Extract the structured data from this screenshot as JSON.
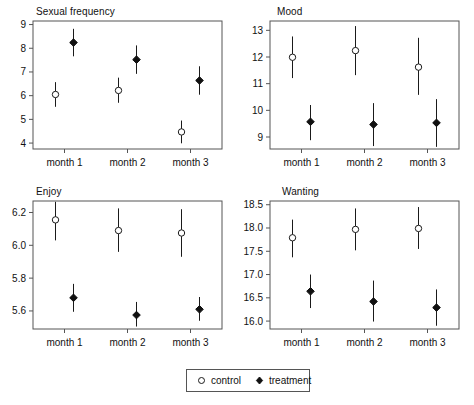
{
  "legend": {
    "entries": [
      {
        "label": "control",
        "marker": "open-circle-marker"
      },
      {
        "label": "treatment",
        "marker": "filled-diamond-marker"
      }
    ]
  },
  "series_colors": {
    "control": "#ffffff",
    "treatment": "#111111",
    "axis": "#555555"
  },
  "chart_data": [
    {
      "type": "scatter",
      "title": "Sexual frequency",
      "xlabel": "",
      "ylabel": "",
      "categories": [
        "month 1",
        "month 2",
        "month 3"
      ],
      "ylim": [
        3.75,
        9.15
      ],
      "yticks": [
        4,
        5,
        6,
        7,
        8,
        9
      ],
      "ytick_labels": [
        "4",
        "5",
        "6",
        "7",
        "8",
        "9"
      ],
      "grid": false,
      "legend_position": "bottom",
      "series": [
        {
          "name": "control",
          "values": [
            6.05,
            6.22,
            4.47
          ],
          "err_low": [
            5.53,
            5.7,
            3.99
          ],
          "err_high": [
            6.57,
            6.76,
            4.95
          ]
        },
        {
          "name": "treatment",
          "values": [
            8.24,
            7.52,
            6.64
          ],
          "err_low": [
            7.66,
            6.92,
            6.04
          ],
          "err_high": [
            8.82,
            8.12,
            7.24
          ]
        }
      ]
    },
    {
      "type": "scatter",
      "title": "Mood",
      "xlabel": "",
      "ylabel": "",
      "categories": [
        "month 1",
        "month 2",
        "month 3"
      ],
      "ylim": [
        8.55,
        13.35
      ],
      "yticks": [
        9,
        10,
        11,
        12,
        13
      ],
      "ytick_labels": [
        "9",
        "10",
        "11",
        "12",
        "13"
      ],
      "grid": false,
      "legend_position": "bottom",
      "series": [
        {
          "name": "control",
          "values": [
            11.99,
            12.24,
            11.62
          ],
          "err_low": [
            11.21,
            11.32,
            10.58
          ],
          "err_high": [
            12.77,
            13.16,
            12.72
          ]
        },
        {
          "name": "treatment",
          "values": [
            9.57,
            9.47,
            9.53
          ],
          "err_low": [
            8.88,
            8.66,
            8.63
          ],
          "err_high": [
            10.2,
            10.27,
            10.42
          ]
        }
      ]
    },
    {
      "type": "scatter",
      "title": "Enjoy",
      "xlabel": "",
      "ylabel": "",
      "categories": [
        "month 1",
        "month 2",
        "month 3"
      ],
      "ylim": [
        5.49,
        6.27
      ],
      "yticks": [
        5.6,
        5.8,
        6.0,
        6.2
      ],
      "ytick_labels": [
        "5.6",
        "5.8",
        "6.0",
        "6.2"
      ],
      "grid": false,
      "legend_position": "bottom",
      "series": [
        {
          "name": "control",
          "values": [
            6.155,
            6.09,
            6.075
          ],
          "err_low": [
            6.03,
            5.96,
            5.93
          ],
          "err_high": [
            6.265,
            6.225,
            6.22
          ]
        },
        {
          "name": "treatment",
          "values": [
            5.68,
            5.575,
            5.61
          ],
          "err_low": [
            5.595,
            5.505,
            5.54
          ],
          "err_high": [
            5.765,
            5.655,
            5.685
          ]
        }
      ]
    },
    {
      "type": "scatter",
      "title": "Wanting",
      "xlabel": "",
      "ylabel": "",
      "categories": [
        "month 1",
        "month 2",
        "month 3"
      ],
      "ylim": [
        15.83,
        18.58
      ],
      "yticks": [
        16.0,
        16.5,
        17.0,
        17.5,
        18.0,
        18.5
      ],
      "ytick_labels": [
        "16.0",
        "16.5",
        "17.0",
        "17.5",
        "18.0",
        "18.5"
      ],
      "grid": false,
      "legend_position": "bottom",
      "series": [
        {
          "name": "control",
          "values": [
            17.79,
            17.97,
            17.99
          ],
          "err_low": [
            17.37,
            17.52,
            17.55
          ],
          "err_high": [
            18.18,
            18.42,
            18.45
          ]
        },
        {
          "name": "treatment",
          "values": [
            16.64,
            16.42,
            16.29
          ],
          "err_low": [
            16.28,
            15.99,
            15.9
          ],
          "err_high": [
            17.0,
            16.87,
            16.68
          ]
        }
      ]
    }
  ]
}
